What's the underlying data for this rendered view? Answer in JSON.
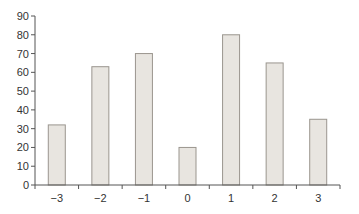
{
  "chart_data": {
    "type": "bar",
    "title": "",
    "xlabel": "",
    "ylabel": "",
    "categories": [
      "−3",
      "−2",
      "−1",
      "0",
      "1",
      "2",
      "3"
    ],
    "values": [
      32,
      63,
      70,
      20,
      80,
      65,
      35
    ],
    "ylim": [
      0,
      90
    ],
    "yticks": [
      0,
      10,
      20,
      30,
      40,
      50,
      60,
      70,
      80,
      90
    ],
    "grid": false,
    "legend": null,
    "colors": {
      "bar_fill": "#e8e5e0",
      "bar_stroke": "#9a958e",
      "axis": "#555555",
      "text": "#333333"
    }
  }
}
